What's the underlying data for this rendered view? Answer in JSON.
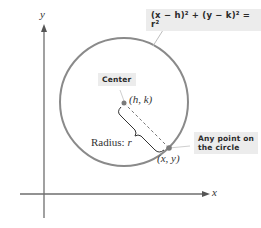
{
  "diagram": {
    "axes": {
      "x_label": "x",
      "y_label": "y"
    },
    "equation": "(x − h)² + (y − k)² = r²",
    "center_callout": "Center",
    "center_point": "(h, k)",
    "radius_label_prefix": "Radius: ",
    "radius_symbol": "r",
    "point_label": "(x, y)",
    "point_callout_line1": "Any point on",
    "point_callout_line2": "the circle",
    "colors": {
      "circle_stroke": "#8a8a8a",
      "axis": "#6e6e6e",
      "callout_bg": "#ececec",
      "point": "#7a7a7a",
      "text": "#333333"
    }
  }
}
